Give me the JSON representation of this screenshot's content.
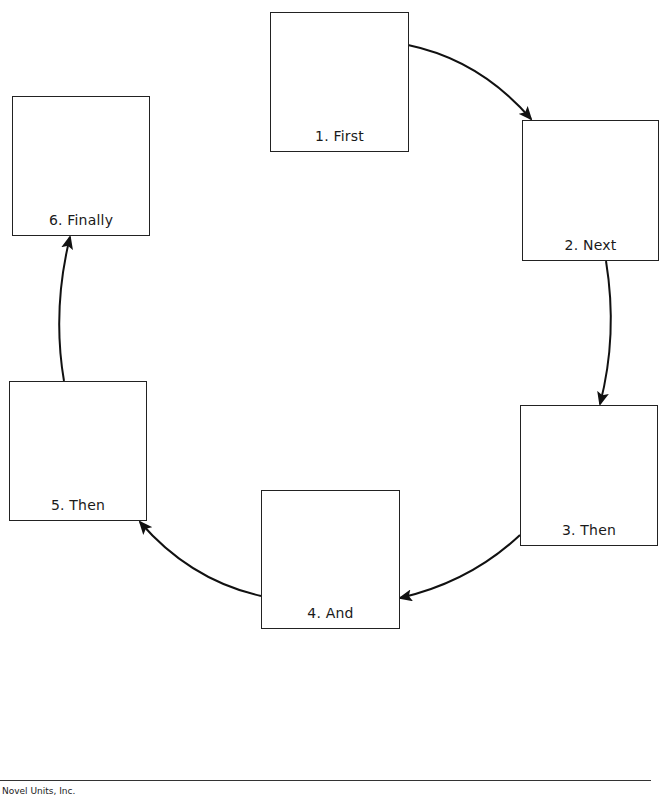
{
  "diagram": {
    "type": "cycle",
    "colors": {
      "stroke": "#222222",
      "box_fill": "#ffffff",
      "text": "#1a1a1a"
    },
    "steps": [
      {
        "label": "1. First"
      },
      {
        "label": "2. Next"
      },
      {
        "label": "3. Then"
      },
      {
        "label": "4. And"
      },
      {
        "label": "5. Then"
      },
      {
        "label": "6. Finally"
      }
    ],
    "connections": [
      {
        "from": "1. First",
        "to": "2. Next"
      },
      {
        "from": "2. Next",
        "to": "3. Then"
      },
      {
        "from": "3. Then",
        "to": "4. And"
      },
      {
        "from": "4. And",
        "to": "5. Then"
      },
      {
        "from": "5. Then",
        "to": "6. Finally"
      }
    ]
  },
  "footer": {
    "publisher": "Novel Units, Inc."
  }
}
